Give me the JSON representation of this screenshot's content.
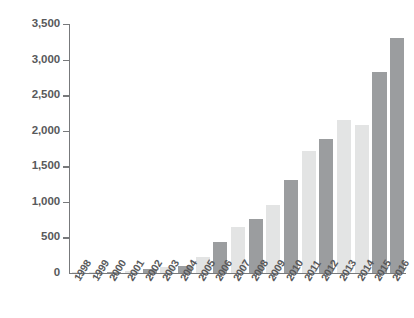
{
  "chart_data": {
    "type": "bar",
    "title": "",
    "subtitle": "",
    "xlabel": "",
    "ylabel": "",
    "categories": [
      "1998",
      "1999",
      "2000",
      "2001",
      "2002",
      "2003",
      "2004",
      "2005",
      "2006",
      "2007",
      "2008",
      "2009",
      "2010",
      "2011",
      "2012",
      "2013",
      "2014",
      "2015",
      "2016"
    ],
    "values": [
      5,
      10,
      20,
      35,
      55,
      80,
      100,
      230,
      440,
      650,
      760,
      950,
      1310,
      1720,
      1880,
      2150,
      2080,
      2830,
      3300
    ],
    "series": [
      {
        "name": "Value",
        "values": [
          5,
          10,
          20,
          35,
          55,
          80,
          100,
          230,
          440,
          650,
          760,
          950,
          1310,
          1720,
          1880,
          2150,
          2080,
          2830,
          3300
        ]
      }
    ],
    "ylim": [
      0,
      3500
    ],
    "yticks": [
      0,
      500,
      1000,
      1500,
      2000,
      2500,
      3000,
      3500
    ],
    "ytick_labels": [
      "0",
      "500",
      "1,000",
      "1,500",
      "2,000",
      "2,500",
      "3,000",
      "3,500"
    ],
    "xtick_labels": [
      "1998",
      "1999",
      "2000",
      "2001",
      "2002",
      "2003",
      "2004",
      "2005",
      "2006",
      "2007",
      "2008",
      "2009",
      "2010",
      "2011",
      "2012",
      "2013",
      "2014",
      "2015",
      "2016"
    ],
    "grid": false,
    "legend": null,
    "legend_position": "none",
    "bar_colors_alternating": [
      "#e3e4e4",
      "#9b9d9f"
    ],
    "bar_color_pattern": [
      "light",
      "light",
      "dark",
      "light",
      "dark",
      "light",
      "dark",
      "light",
      "dark",
      "light",
      "dark",
      "light",
      "dark",
      "light",
      "dark",
      "light",
      "light",
      "dark",
      "dark"
    ],
    "annotations": [],
    "axis_color": "#77797b",
    "label_color": "#58595b",
    "background": "#ffffff"
  }
}
